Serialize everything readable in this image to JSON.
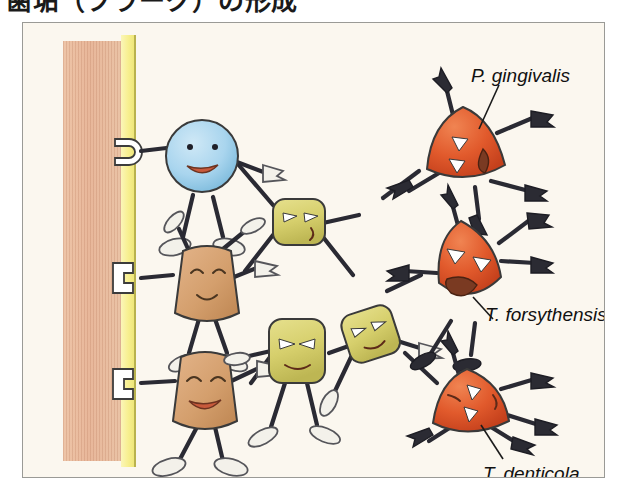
{
  "heading": {
    "text": "歯垢（プラーク）の形成"
  },
  "panel": {
    "name": "biofilm-illustration",
    "background_color": "#fbf7ef",
    "border_color": "#9a9a96"
  },
  "structures": [
    {
      "id": "tooth-surface",
      "name": "tooth-surface",
      "description": "tan hatched vertical bar representing the tooth surface",
      "color": "#e8b79a"
    },
    {
      "id": "pellicle",
      "name": "pellicle-layer",
      "description": "yellow vertical strip representing acquired pellicle with receptors",
      "color": "#f7ef90"
    }
  ],
  "labels": [
    {
      "id": "pg",
      "name": "label-p-gingivalis",
      "text": "P. gingivalis"
    },
    {
      "id": "tf",
      "name": "label-t-forsythensis",
      "text": "T. forsythensis"
    },
    {
      "id": "td",
      "name": "label-t-denticola",
      "text": "T. denticola"
    }
  ],
  "bacteria": [
    {
      "id": "coccus-blue",
      "name": "blue-coccus-character",
      "shape": "round",
      "color": "#a8d4ec",
      "expression": "smiling",
      "attachment": "round-hook-receptor"
    },
    {
      "id": "brown-upper",
      "name": "brown-rod-character-upper",
      "shape": "rounded-trapezoid",
      "color": "#d8a273",
      "expression": "happy-closed-eyes",
      "attachment": "bracket-receptor"
    },
    {
      "id": "brown-lower",
      "name": "brown-rod-character-lower",
      "shape": "rounded-trapezoid",
      "color": "#d8a273",
      "expression": "laughing-open-mouth",
      "attachment": "bracket-receptor"
    },
    {
      "id": "yellow-top",
      "name": "yellow-square-character-top",
      "shape": "rounded-square",
      "color": "#d8d272",
      "expression": "angry-frown"
    },
    {
      "id": "yellow-middle",
      "name": "yellow-square-character-middle",
      "shape": "rounded-square",
      "color": "#d8d272",
      "expression": "angry-frown"
    },
    {
      "id": "yellow-right",
      "name": "yellow-square-character-right",
      "shape": "rounded-square",
      "color": "#d8d272",
      "expression": "angry-frown"
    },
    {
      "id": "red-top",
      "name": "red-pathogen-character-top",
      "shape": "triangular-blob",
      "color": "#e0552c",
      "expression": "angry-open-mouth",
      "label_ref": "pg"
    },
    {
      "id": "red-middle",
      "name": "red-pathogen-character-middle",
      "shape": "triangular-blob",
      "color": "#e0552c",
      "expression": "angry-jagged-mouth",
      "label_ref": "tf"
    },
    {
      "id": "red-bottom",
      "name": "red-pathogen-character-bottom",
      "shape": "triangular-blob",
      "color": "#e0552c",
      "expression": "angry-closed-mouth",
      "label_ref": "td"
    }
  ]
}
